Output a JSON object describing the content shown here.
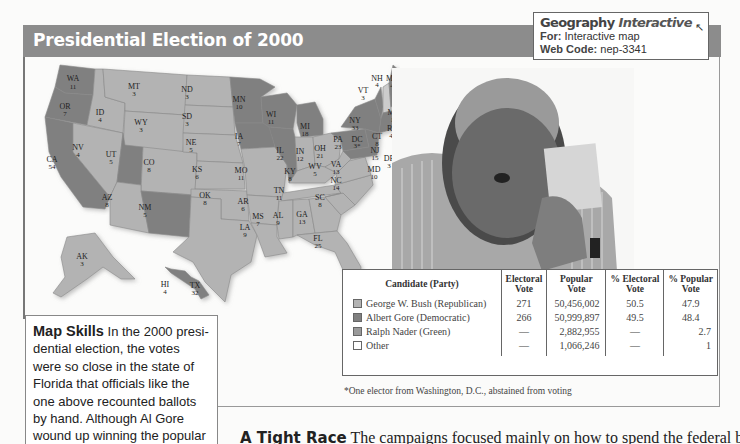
{
  "header": {
    "title": "Presidential  Election of 2000"
  },
  "geography_interactive": {
    "brand_bold": "Geography",
    "brand_italic": "Interactive",
    "for_label": "For:",
    "for_value": "Interactive map",
    "webcode_label": "Web Code:",
    "webcode_value": "nep-3341",
    "cursor_icon": "mouse-pointer-icon"
  },
  "map": {
    "colors": {
      "republican": "#b3b3b3",
      "democratic": "#808080",
      "border": "#8a8a8a"
    },
    "states": [
      {
        "abbr": "WA",
        "votes": "11",
        "party": "democratic"
      },
      {
        "abbr": "OR",
        "votes": "7",
        "party": "democratic"
      },
      {
        "abbr": "CA",
        "votes": "54",
        "party": "democratic"
      },
      {
        "abbr": "ID",
        "votes": "4",
        "party": "republican"
      },
      {
        "abbr": "NV",
        "votes": "4",
        "party": "republican"
      },
      {
        "abbr": "MT",
        "votes": "3",
        "party": "republican"
      },
      {
        "abbr": "WY",
        "votes": "3",
        "party": "republican"
      },
      {
        "abbr": "UT",
        "votes": "5",
        "party": "republican"
      },
      {
        "abbr": "AZ",
        "votes": "8",
        "party": "republican"
      },
      {
        "abbr": "CO",
        "votes": "8",
        "party": "republican"
      },
      {
        "abbr": "NM",
        "votes": "5",
        "party": "democratic"
      },
      {
        "abbr": "ND",
        "votes": "3",
        "party": "republican"
      },
      {
        "abbr": "SD",
        "votes": "3",
        "party": "republican"
      },
      {
        "abbr": "NE",
        "votes": "5",
        "party": "republican"
      },
      {
        "abbr": "KS",
        "votes": "6",
        "party": "republican"
      },
      {
        "abbr": "OK",
        "votes": "8",
        "party": "republican"
      },
      {
        "abbr": "TX",
        "votes": "32",
        "party": "republican"
      },
      {
        "abbr": "MN",
        "votes": "10",
        "party": "democratic"
      },
      {
        "abbr": "IA",
        "votes": "7",
        "party": "democratic"
      },
      {
        "abbr": "MO",
        "votes": "11",
        "party": "republican"
      },
      {
        "abbr": "AR",
        "votes": "6",
        "party": "republican"
      },
      {
        "abbr": "LA",
        "votes": "9",
        "party": "republican"
      },
      {
        "abbr": "WI",
        "votes": "11",
        "party": "democratic"
      },
      {
        "abbr": "IL",
        "votes": "22",
        "party": "democratic"
      },
      {
        "abbr": "MI",
        "votes": "18",
        "party": "democratic"
      },
      {
        "abbr": "IN",
        "votes": "12",
        "party": "republican"
      },
      {
        "abbr": "OH",
        "votes": "21",
        "party": "republican"
      },
      {
        "abbr": "KY",
        "votes": "8",
        "party": "republican"
      },
      {
        "abbr": "TN",
        "votes": "11",
        "party": "republican"
      },
      {
        "abbr": "MS",
        "votes": "7",
        "party": "republican"
      },
      {
        "abbr": "AL",
        "votes": "9",
        "party": "republican"
      },
      {
        "abbr": "GA",
        "votes": "13",
        "party": "republican"
      },
      {
        "abbr": "FL",
        "votes": "25",
        "party": "republican"
      },
      {
        "abbr": "SC",
        "votes": "8",
        "party": "republican"
      },
      {
        "abbr": "NC",
        "votes": "14",
        "party": "republican"
      },
      {
        "abbr": "VA",
        "votes": "13",
        "party": "republican"
      },
      {
        "abbr": "WV",
        "votes": "5",
        "party": "republican"
      },
      {
        "abbr": "PA",
        "votes": "23",
        "party": "democratic"
      },
      {
        "abbr": "NY",
        "votes": "33",
        "party": "democratic"
      },
      {
        "abbr": "VT",
        "votes": "3",
        "party": "democratic"
      },
      {
        "abbr": "NH",
        "votes": "4",
        "party": "republican"
      },
      {
        "abbr": "ME",
        "votes": "4",
        "party": "democratic"
      },
      {
        "abbr": "MA",
        "votes": "12",
        "party": "democratic"
      },
      {
        "abbr": "RI",
        "votes": "4",
        "party": "democratic"
      },
      {
        "abbr": "CT",
        "votes": "8",
        "party": "democratic"
      },
      {
        "abbr": "NJ",
        "votes": "15",
        "party": "democratic"
      },
      {
        "abbr": "DE",
        "votes": "3",
        "party": "democratic"
      },
      {
        "abbr": "MD",
        "votes": "10",
        "party": "democratic"
      },
      {
        "abbr": "DC",
        "votes": "3*",
        "party": "democratic"
      },
      {
        "abbr": "AK",
        "votes": "3",
        "party": "republican"
      },
      {
        "abbr": "HI",
        "votes": "4",
        "party": "democratic"
      }
    ]
  },
  "results_table": {
    "headers": [
      "Candidate (Party)",
      "Electoral Vote",
      "Popular Vote",
      "% Electoral Vote",
      "% Popular Vote"
    ],
    "header_lines": [
      [
        "Candidate (Party)",
        ""
      ],
      [
        "Electoral",
        "Vote"
      ],
      [
        "Popular",
        "Vote"
      ],
      [
        "% Electoral",
        "Vote"
      ],
      [
        "% Popular",
        "Vote"
      ]
    ],
    "rows": [
      {
        "candidate": "George W. Bush (Republican)",
        "swatch": "#b3b3b3",
        "electoral": "271",
        "popular": "50,456,002",
        "pct_electoral": "50.5",
        "pct_popular": "47.9"
      },
      {
        "candidate": "Albert Gore (Democratic)",
        "swatch": "#808080",
        "electoral": "266",
        "popular": "50,999,897",
        "pct_electoral": "49.5",
        "pct_popular": "48.4"
      },
      {
        "candidate": "Ralph Nader (Green)",
        "swatch": "#9a9a9a",
        "electoral": "—",
        "popular": "2,882,955",
        "pct_electoral": "—",
        "pct_popular": "2.7"
      },
      {
        "candidate": "Other",
        "swatch": "#ffffff",
        "electoral": "—",
        "popular": "1,066,246",
        "pct_electoral": "—",
        "pct_popular": "1"
      }
    ],
    "footnote": "*One elector from Washington, D.C., abstained from voting"
  },
  "map_skills": {
    "heading": "Map Skills",
    "text": "  In the 2000 presi-dential election, the votes were so close in the state of Florida that officials like the one above recounted ballots by hand. Although Al Gore wound up winning the popular vote,"
  },
  "body_text": {
    "lead": "A Tight Race",
    "rest": "  The campaigns focused mainly on how to spend the federal bud-"
  },
  "photo": {
    "description": "Election official inspecting a punch-card ballot"
  }
}
